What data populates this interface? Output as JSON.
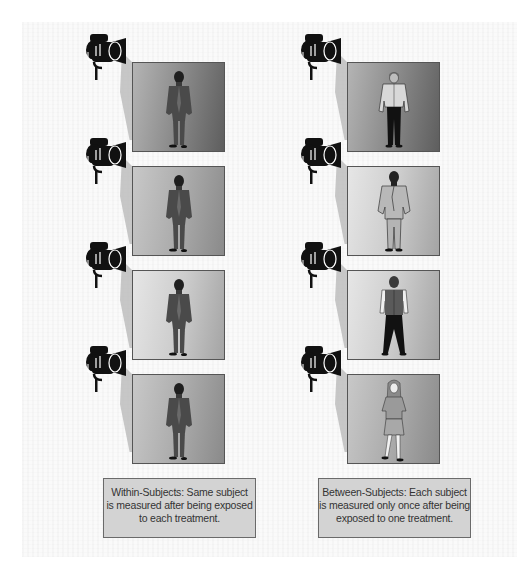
{
  "diagram": {
    "columns": [
      {
        "id": "within",
        "caption_lines": [
          "Within-Subjects: Same subject",
          "is measured after being exposed",
          "to each treatment."
        ],
        "panels": [
          {
            "subject": "man-in-dark-suit",
            "background": "dark"
          },
          {
            "subject": "man-in-dark-suit",
            "background": "mid"
          },
          {
            "subject": "man-in-dark-suit",
            "background": "light"
          },
          {
            "subject": "man-in-dark-suit",
            "background": "mid"
          }
        ]
      },
      {
        "id": "between",
        "caption_lines": [
          "Between-Subjects: Each subject",
          "is measured only once after being",
          "exposed to one treatment."
        ],
        "panels": [
          {
            "subject": "man-in-cap-and-jacket",
            "background": "dark"
          },
          {
            "subject": "man-in-light-suit",
            "background": "light"
          },
          {
            "subject": "man-in-vest",
            "background": "light"
          },
          {
            "subject": "woman-in-skirt",
            "background": "mid"
          }
        ]
      }
    ],
    "icons": {
      "camera": "video-camera-icon",
      "light_beam": "camera-light-cone"
    },
    "colors": {
      "caption_bg": "#d3d3d3",
      "caption_border": "#6a6a6a",
      "cone": "#bdbdbd",
      "camera": "#111111"
    }
  }
}
